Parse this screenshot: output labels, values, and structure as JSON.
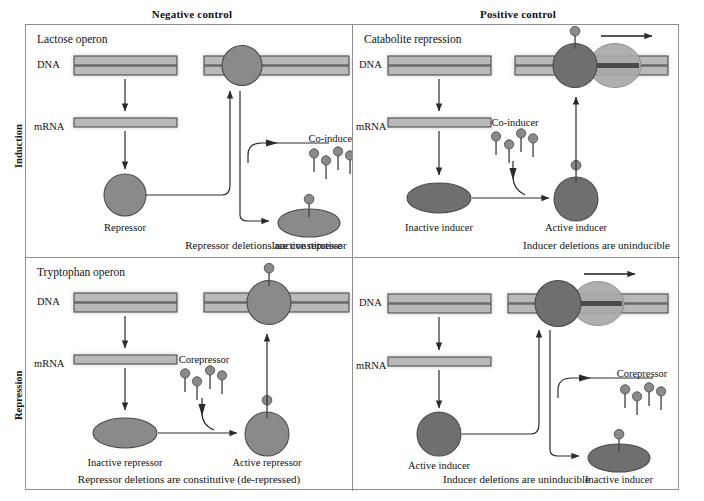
{
  "figure": {
    "type": "diagram",
    "columns": [
      "Negative control",
      "Positive control"
    ],
    "rows": [
      "Induction",
      "Repression"
    ]
  },
  "headers": {
    "negative_control": "Negative control",
    "positive_control": "Positive control",
    "induction": "Induction",
    "repression": "Repression"
  },
  "panels": {
    "top_left": {
      "title": "Lactose operon",
      "caption": "Repressor deletions are constitutive",
      "dna_label": "DNA",
      "mrna_label": "mRNA",
      "protein_label": "Repressor",
      "effector_label": "Co-inducer",
      "result_label": "Inactive repressor",
      "bound_state": "repressor bound to DNA (transcription blocked)",
      "effector_count": 4
    },
    "top_right": {
      "title": "Catabolite repression",
      "caption": "Inducer deletions are uninducible",
      "dna_label": "DNA",
      "mrna_label": "mRNA",
      "protein_label": "Inactive inducer",
      "effector_label": "Co-inducer",
      "result_label": "Active inducer",
      "bound_state": "active inducer bound to DNA with RNA polymerase transcribing",
      "effector_count": 4
    },
    "bottom_left": {
      "title": "Tryptophan operon",
      "caption": "Repressor deletions are constitutive  (de-repressed)",
      "dna_label": "DNA",
      "mrna_label": "mRNA",
      "protein_label": "Inactive repressor",
      "effector_label": "Corepressor",
      "result_label": "Active repressor",
      "bound_state": "active repressor bound to DNA (transcription blocked)",
      "effector_count": 4
    },
    "bottom_right": {
      "title": "",
      "caption": "Inducer deletions are uninducible",
      "dna_label": "DNA",
      "mrna_label": "mRNA",
      "protein_label": "Active inducer",
      "effector_label": "Corepressor",
      "result_label": "Inactive inducer",
      "bound_state": "active inducer bound to DNA with RNA polymerase transcribing",
      "effector_count": 4
    }
  },
  "colors": {
    "protein_fill": "#8a8a8a",
    "protein_stroke": "#4a4a4a",
    "dna_fill": "#b9b9b9",
    "dna_stroke": "#4d4d4d",
    "polymerase_fill": "#a9a9a9",
    "arrow": "#2b2b2b",
    "panel_border": "#8d8d93",
    "background": "#ffffff"
  }
}
